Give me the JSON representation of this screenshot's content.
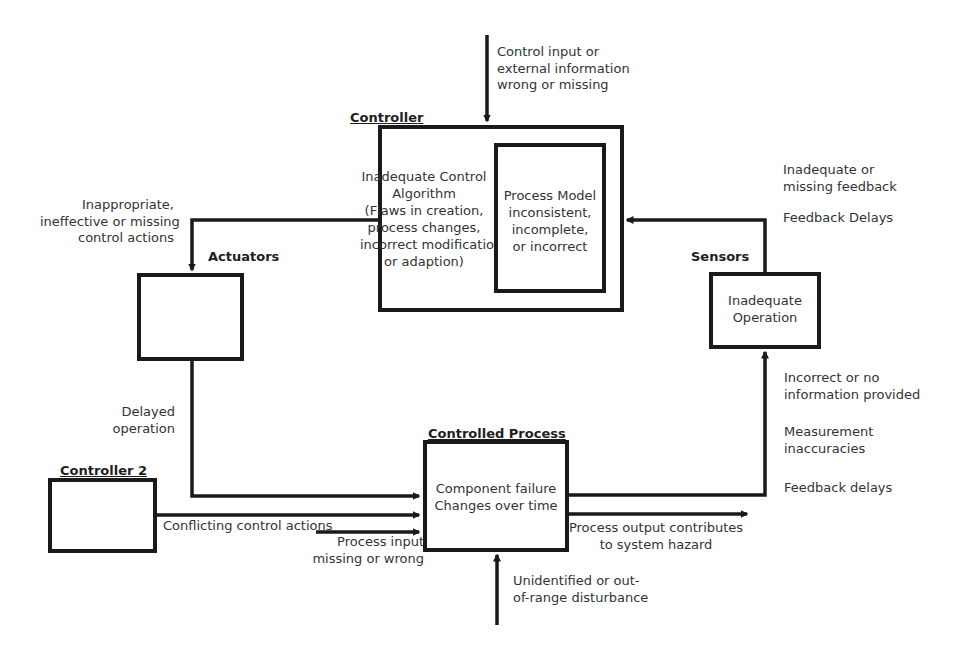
{
  "diagram": {
    "nodes": {
      "controller": {
        "title": "Controller",
        "algorithm_text": "Inadequate Control\nAlgorithm\n(Flaws in creation,\nprocess changes,\nincorrect modification\nor adaption)",
        "process_model_text": "Process Model\ninconsistent,\nincomplete,\nor incorrect"
      },
      "actuators": {
        "title": "Actuators"
      },
      "sensors": {
        "title": "Sensors",
        "text": "Inadequate\nOperation"
      },
      "controlled_process": {
        "title": "Controlled Process",
        "text": "Component failure\nChanges over time"
      },
      "controller2": {
        "title": "Controller 2"
      }
    },
    "edge_labels": {
      "control_input": "Control input or\nexternal information\nwrong or missing",
      "control_actions": "Inappropriate,\nineffective or missing\ncontrol actions",
      "feedback": "Inadequate or\nmissing feedback",
      "feedback_delays_top": "Feedback Delays",
      "delayed_operation": "Delayed\noperation",
      "conflicting": "Conflicting control actions",
      "process_input": "Process input\nmissing or wrong",
      "output_hazard": "Process output contributes\nto system hazard",
      "disturbance": "Unidentified or out-\nof-range disturbance",
      "incorrect_info": "Incorrect or no\ninformation provided",
      "measurement": "Measurement\ninaccuracies",
      "feedback_delays_bottom": "Feedback delays"
    }
  }
}
